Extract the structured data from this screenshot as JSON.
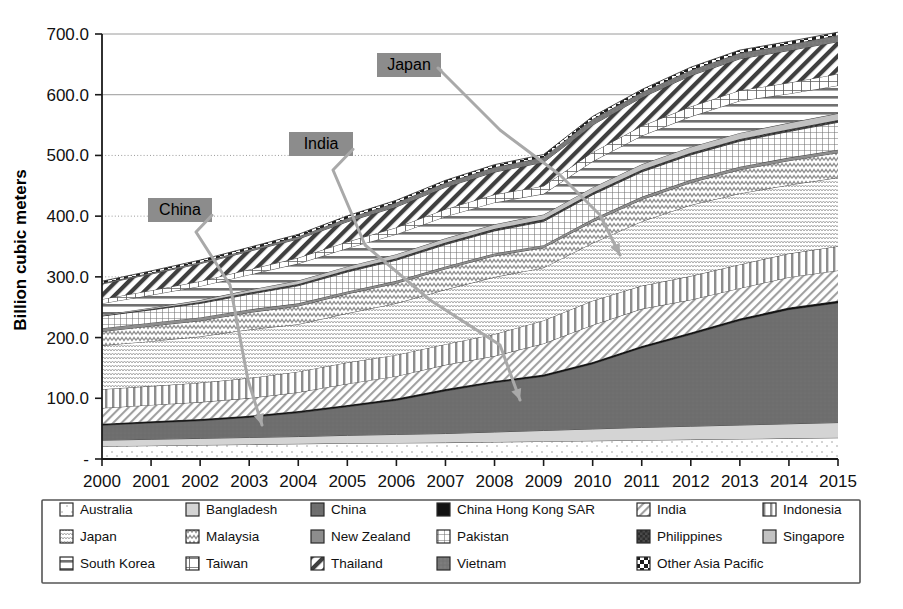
{
  "chart_data": {
    "type": "area",
    "stacked": true,
    "title": "",
    "subtitle": "",
    "xlabel": "",
    "ylabel": "Billion cubic meters",
    "x": [
      2000,
      2001,
      2002,
      2003,
      2004,
      2005,
      2006,
      2007,
      2008,
      2009,
      2010,
      2011,
      2012,
      2013,
      2014,
      2015
    ],
    "xtick_labels": [
      "2000",
      "2001",
      "2002",
      "2003",
      "2004",
      "2005",
      "2006",
      "2007",
      "2008",
      "2009",
      "2010",
      "2011",
      "2012",
      "2013",
      "2014",
      "2015"
    ],
    "ytick_labels": [
      "-",
      "100.0",
      "200.0",
      "300.0",
      "400.0",
      "500.0",
      "600.0",
      "700.0"
    ],
    "ytick_values": [
      0,
      100,
      200,
      300,
      400,
      500,
      600,
      700
    ],
    "ylim": [
      0,
      700
    ],
    "grid": "horizontal",
    "legend_position": "bottom",
    "series": [
      {
        "name": "Australia",
        "pattern": "dotted-sparse",
        "values": [
          21.0,
          22.0,
          23.0,
          24.0,
          25.0,
          26.0,
          26.5,
          27.0,
          28.0,
          29.0,
          30.0,
          31.0,
          32.0,
          33.0,
          34.0,
          35.0
        ]
      },
      {
        "name": "Bangladesh",
        "pattern": "solid-light-gray",
        "values": [
          10.0,
          10.5,
          11.0,
          11.5,
          12.0,
          13.0,
          14.0,
          15.0,
          16.5,
          18.0,
          19.5,
          21.0,
          22.0,
          23.0,
          24.0,
          25.0
        ]
      },
      {
        "name": "China",
        "pattern": "solid-dark-gray",
        "values": [
          24.5,
          27.0,
          29.0,
          33.0,
          39.0,
          47.0,
          56.0,
          70.0,
          81.0,
          89.0,
          107.0,
          131.0,
          151.0,
          172.0,
          188.0,
          197.0
        ]
      },
      {
        "name": "China Hong Kong SAR",
        "pattern": "solid-black",
        "values": [
          2.5,
          2.6,
          2.7,
          2.8,
          2.9,
          3.0,
          3.0,
          3.1,
          3.1,
          3.2,
          3.2,
          3.3,
          3.3,
          3.4,
          3.4,
          3.5
        ]
      },
      {
        "name": "India",
        "pattern": "diagonal-fine",
        "values": [
          26.0,
          27.0,
          28.0,
          29.0,
          31.0,
          35.0,
          37.0,
          40.0,
          41.0,
          51.0,
          61.0,
          61.0,
          54.0,
          50.0,
          50.0,
          50.0
        ]
      },
      {
        "name": "Indonesia",
        "pattern": "vertical-thick",
        "values": [
          31.0,
          31.0,
          32.0,
          33.0,
          34.0,
          35.0,
          35.0,
          34.0,
          36.0,
          38.0,
          40.0,
          38.0,
          39.0,
          39.0,
          39.0,
          40.0
        ]
      },
      {
        "name": "Japan",
        "pattern": "wavy-fine",
        "values": [
          72.0,
          74.0,
          76.0,
          80.0,
          78.0,
          81.0,
          85.0,
          90.0,
          94.0,
          87.0,
          95.0,
          106.0,
          117.0,
          117.0,
          113.0,
          113.0
        ]
      },
      {
        "name": "Malaysia",
        "pattern": "wavy-coarse",
        "values": [
          23.0,
          25.0,
          26.0,
          28.0,
          30.0,
          32.0,
          33.0,
          34.0,
          35.0,
          33.0,
          35.0,
          36.0,
          37.0,
          39.0,
          40.0,
          41.0
        ]
      },
      {
        "name": "New Zealand",
        "pattern": "solid-mid-gray",
        "values": [
          5.5,
          5.5,
          5.5,
          5.0,
          4.5,
          4.0,
          4.0,
          4.0,
          4.0,
          4.0,
          4.5,
          4.5,
          4.5,
          5.0,
          5.0,
          5.0
        ]
      },
      {
        "name": "Pakistan",
        "pattern": "grid-fine",
        "values": [
          20.0,
          21.0,
          23.0,
          25.0,
          29.0,
          32.0,
          34.0,
          36.0,
          37.0,
          39.0,
          40.0,
          41.0,
          41.0,
          42.0,
          43.0,
          45.0
        ]
      },
      {
        "name": "Philippines",
        "pattern": "checker-dark",
        "values": [
          0.3,
          1.5,
          2.5,
          2.8,
          3.0,
          3.2,
          3.3,
          3.4,
          3.5,
          3.5,
          3.6,
          3.6,
          3.7,
          3.7,
          3.8,
          3.8
        ]
      },
      {
        "name": "Singapore",
        "pattern": "solid-pale-gray",
        "values": [
          1.5,
          2.0,
          3.0,
          4.5,
          5.5,
          6.0,
          6.5,
          7.0,
          7.5,
          8.0,
          8.5,
          9.0,
          9.5,
          10.0,
          10.5,
          11.0
        ]
      },
      {
        "name": "South Korea",
        "pattern": "horizontal-thick",
        "values": [
          19.0,
          21.0,
          23.0,
          25.0,
          28.0,
          30.0,
          33.0,
          36.0,
          36.0,
          34.0,
          43.0,
          47.0,
          50.0,
          53.0,
          48.0,
          46.0
        ]
      },
      {
        "name": "Taiwan",
        "pattern": "grid-window",
        "values": [
          7.0,
          7.5,
          8.0,
          8.5,
          9.5,
          10.5,
          11.0,
          12.0,
          13.0,
          13.0,
          15.0,
          16.0,
          16.5,
          17.0,
          18.0,
          19.0
        ]
      },
      {
        "name": "Thailand",
        "pattern": "diagonal-thick",
        "values": [
          25.0,
          27.0,
          29.0,
          30.0,
          31.0,
          33.0,
          34.0,
          36.0,
          37.0,
          39.0,
          45.0,
          47.0,
          51.0,
          52.0,
          53.0,
          53.0
        ]
      },
      {
        "name": "Vietnam",
        "pattern": "solid-speckled-gray",
        "values": [
          1.5,
          2.0,
          2.5,
          3.0,
          4.0,
          6.0,
          7.0,
          7.5,
          8.0,
          8.5,
          9.5,
          8.5,
          9.0,
          9.5,
          10.0,
          10.5
        ]
      },
      {
        "name": "Other Asia Pacific",
        "pattern": "checker-bold",
        "values": [
          3.0,
          3.2,
          3.4,
          3.5,
          3.6,
          3.8,
          3.9,
          4.0,
          4.2,
          4.3,
          4.5,
          4.6,
          4.8,
          4.9,
          5.0,
          5.2
        ]
      }
    ],
    "totals": [
      293.0,
      311.0,
      327.0,
      349.0,
      371.0,
      400.0,
      424.0,
      459.0,
      485.0,
      501.0,
      565.0,
      612.0,
      650.0,
      680.0,
      691.0,
      703.0
    ],
    "annotations": [
      {
        "label": "China",
        "x": 148,
        "y": 198
      },
      {
        "label": "India",
        "x": 289,
        "y": 132
      },
      {
        "label": "Japan",
        "x": 377,
        "y": 53
      }
    ]
  },
  "legend": {
    "rows": [
      [
        {
          "label": "Australia",
          "pattern": "dotted-sparse"
        },
        {
          "label": "Bangladesh",
          "pattern": "solid-light-gray"
        },
        {
          "label": "China",
          "pattern": "solid-dark-gray"
        },
        {
          "label": "China Hong Kong SAR",
          "pattern": "solid-black"
        },
        {
          "label": "India",
          "pattern": "diagonal-fine"
        },
        {
          "label": "Indonesia",
          "pattern": "vertical-thick"
        }
      ],
      [
        {
          "label": "Japan",
          "pattern": "wavy-fine"
        },
        {
          "label": "Malaysia",
          "pattern": "wavy-coarse"
        },
        {
          "label": "New Zealand",
          "pattern": "solid-mid-gray"
        },
        {
          "label": "Pakistan",
          "pattern": "grid-fine"
        },
        {
          "label": "Philippines",
          "pattern": "checker-dark"
        },
        {
          "label": "Singapore",
          "pattern": "solid-pale-gray"
        }
      ],
      [
        {
          "label": "South Korea",
          "pattern": "horizontal-thick"
        },
        {
          "label": "Taiwan",
          "pattern": "grid-window"
        },
        {
          "label": "Thailand",
          "pattern": "diagonal-thick"
        },
        {
          "label": "Vietnam",
          "pattern": "solid-speckled-gray"
        },
        {
          "label": "Other Asia Pacific",
          "pattern": "checker-bold"
        },
        {
          "label": "",
          "pattern": "none"
        }
      ]
    ]
  },
  "colors": {
    "callout_bg": "#8c8c8c",
    "leader": "#a9a9a9",
    "axis": "#1a1a1a",
    "grid": "#9a9a9a"
  }
}
